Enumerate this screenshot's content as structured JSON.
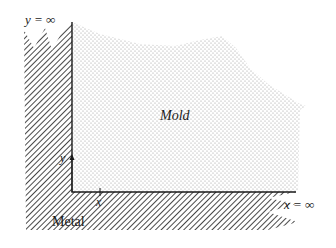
{
  "diagram": {
    "regions": {
      "mold": {
        "label": "Mold"
      },
      "metal": {
        "label": "Metal"
      }
    },
    "labels": {
      "y_infinity": "y = ∞",
      "x_infinity": "x = ∞",
      "y_axis": "y",
      "x_axis": "x"
    },
    "colors": {
      "ink": "#1a1a1a",
      "stipple": "#9a9a9a",
      "background": "#ffffff"
    }
  }
}
